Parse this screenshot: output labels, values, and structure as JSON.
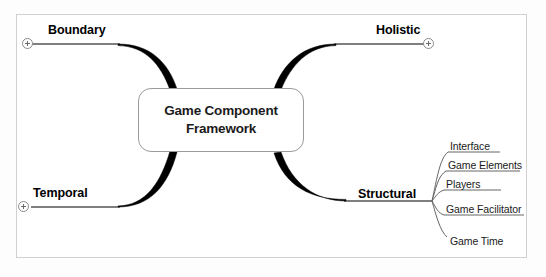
{
  "diagram": {
    "type": "mind-map",
    "central_node": {
      "label": "Game Component Framework",
      "line1": "Game Component",
      "line2": "Framework"
    },
    "branches": [
      {
        "label": "Boundary",
        "position": "top-left",
        "expander": "plus-circle",
        "collapsed": true,
        "children": []
      },
      {
        "label": "Holistic",
        "position": "top-right",
        "expander": "plus-circle",
        "collapsed": true,
        "children": []
      },
      {
        "label": "Temporal",
        "position": "bottom-left",
        "expander": "plus-circle",
        "collapsed": true,
        "children": []
      },
      {
        "label": "Structural",
        "position": "bottom-right",
        "expander": "none",
        "collapsed": false,
        "children": [
          {
            "label": "Interface"
          },
          {
            "label": "Game Elements"
          },
          {
            "label": "Players"
          },
          {
            "label": "Game Facilitator"
          },
          {
            "label": "Game Time"
          }
        ]
      }
    ],
    "colors": {
      "branch_stroke": "#000000",
      "sub_branch_stroke": "#555555",
      "node_border": "#9a9a9a",
      "frame_border": "#d0d0d0",
      "background": "#ffffff",
      "text": "#000000"
    }
  }
}
